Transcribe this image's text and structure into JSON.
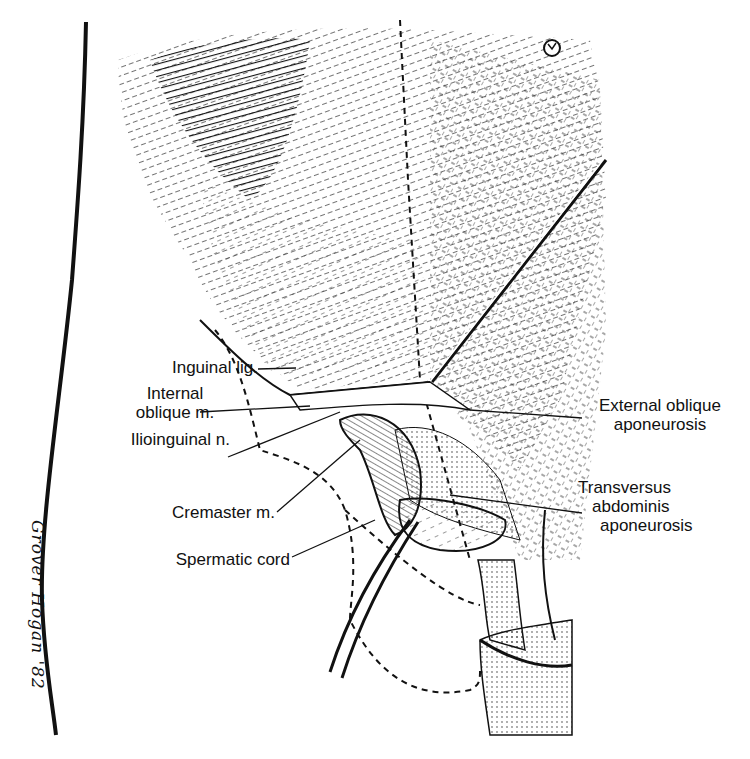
{
  "figure": {
    "type": "anatomical illustration",
    "signature": "Grover Hogan '82"
  },
  "labels": {
    "inguinal_lig": "Inguinal lig.",
    "internal_oblique_1": "Internal",
    "internal_oblique_2": "oblique m.",
    "ilioinguinal": "Ilioinguinal n.",
    "cremaster": "Cremaster m.",
    "spermatic_cord": "Spermatic cord",
    "external_oblique_1": "External oblique",
    "external_oblique_2": "aponeurosis",
    "transversus_1": "Transversus",
    "transversus_2": "abdominis",
    "transversus_3": "aponeurosis"
  },
  "colors": {
    "ink": "#111111",
    "paper": "#ffffff"
  }
}
